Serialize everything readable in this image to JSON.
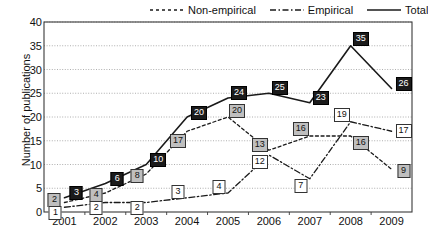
{
  "chart_data": {
    "type": "line",
    "title": "",
    "xlabel": "",
    "ylabel": "Number of publications",
    "categories": [
      "2001",
      "2002",
      "2003",
      "2004",
      "2005",
      "2006",
      "2007",
      "2008",
      "2009"
    ],
    "ylim": [
      0,
      40
    ],
    "ytick_values": [
      0,
      5,
      10,
      15,
      20,
      25,
      30,
      35,
      40
    ],
    "ytick_labels": [
      "0",
      "5",
      "10",
      "15",
      "20",
      "25",
      "30",
      "35",
      "40"
    ],
    "grid": "horizontal-dotted",
    "legend_position": "top-right",
    "series": [
      {
        "name": "Non-empirical",
        "style": "dashed",
        "label_style": "nonemp",
        "values": [
          2,
          4,
          8,
          17,
          20,
          13,
          16,
          16,
          9
        ]
      },
      {
        "name": "Empirical",
        "style": "dash-dot",
        "label_style": "emp",
        "values": [
          1,
          2,
          2,
          3,
          4,
          12,
          7,
          19,
          17
        ]
      },
      {
        "name": "Total",
        "style": "solid",
        "label_style": "total",
        "values": [
          3,
          6,
          10,
          20,
          24,
          25,
          23,
          35,
          26
        ]
      }
    ]
  },
  "legend": {
    "items": [
      {
        "label": "Non-empirical",
        "style": "dashed"
      },
      {
        "label": "Empirical",
        "style": "dash-dot"
      },
      {
        "label": "Total",
        "style": "solid"
      }
    ]
  },
  "colors": {
    "line": "#1a1a1a",
    "grid": "#9a9a9a",
    "axis": "#3a3a3a",
    "total_box_bg": "#1b1b1b",
    "total_box_fg": "#ffffff",
    "nonempirical_box_bg": "#bfbfbf",
    "empirical_box_bg": "#ffffff",
    "text": "#111111"
  }
}
